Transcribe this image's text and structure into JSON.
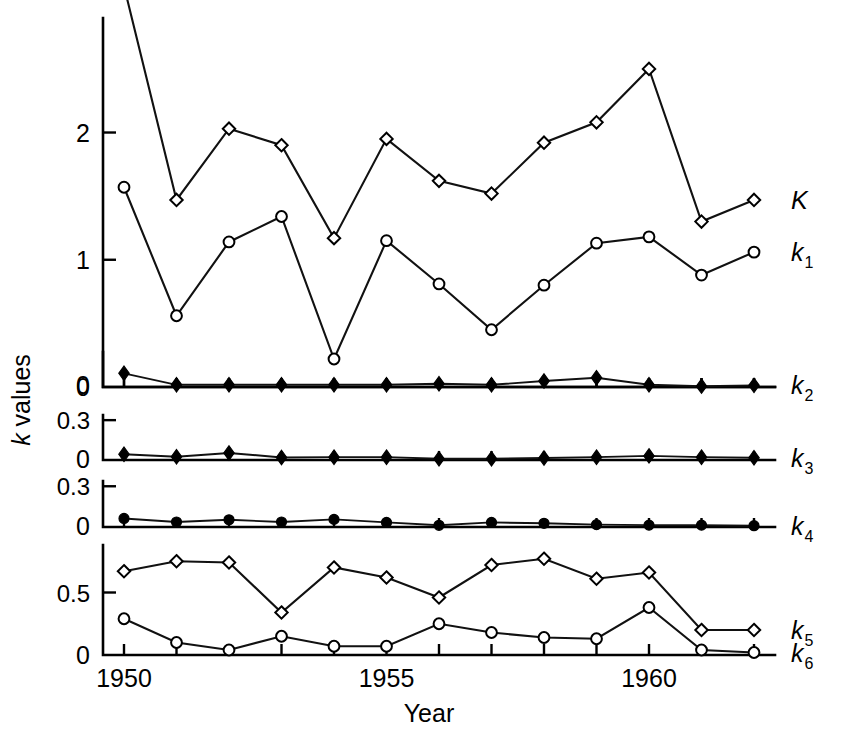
{
  "figure": {
    "y_axis_label_italic": "k",
    "y_axis_label_rest": " values",
    "x_axis_title": "Year",
    "background_color": "#ffffff",
    "line_color": "#111111"
  },
  "chart_data": {
    "type": "line",
    "title": "",
    "xlabel": "Year",
    "ylabel": "k values",
    "grid": false,
    "legend": "right-of-plot-series-labels",
    "x": [
      1950,
      1951,
      1952,
      1953,
      1954,
      1955,
      1956,
      1957,
      1958,
      1959,
      1960,
      1961,
      1962
    ],
    "xtick_labels": [
      "1950",
      "1955",
      "1960"
    ],
    "xtick_values": [
      1950,
      1955,
      1960
    ],
    "xlim": [
      1949.6,
      1962.4
    ],
    "panels": [
      {
        "name": "panel-top",
        "ylim": [
          0,
          2.9
        ],
        "ytick_values": [
          0,
          1,
          2
        ],
        "ytick_labels": [
          "0",
          "1",
          "2"
        ],
        "series": [
          {
            "name": "K",
            "label": "K",
            "label_sub": "",
            "marker": "open-diamond",
            "values": [
              3.15,
              1.47,
              2.03,
              1.9,
              1.17,
              1.95,
              1.62,
              1.52,
              1.92,
              2.08,
              2.5,
              1.3,
              1.47
            ]
          },
          {
            "name": "k1",
            "label": "k",
            "label_sub": "1",
            "marker": "open-circle",
            "values": [
              1.57,
              0.56,
              1.14,
              1.34,
              0.22,
              1.15,
              0.81,
              0.45,
              0.8,
              1.13,
              1.18,
              0.88,
              1.06
            ]
          }
        ]
      },
      {
        "name": "panel-k2",
        "ylim": [
          -0.02,
          0.3
        ],
        "ytick_values": [
          0
        ],
        "ytick_labels": [
          "0"
        ],
        "series": [
          {
            "name": "k2",
            "label": "k",
            "label_sub": "2",
            "marker": "filled-diamond",
            "values": [
              0.105,
              0.0,
              0.0,
              0.0,
              0.0,
              0.0,
              0.01,
              0.0,
              0.035,
              0.065,
              0.0,
              -0.012,
              -0.005
            ]
          }
        ]
      },
      {
        "name": "panel-k3",
        "ylim": [
          -0.01,
          0.34
        ],
        "ytick_values": [
          0,
          0.3
        ],
        "ytick_labels": [
          "0",
          "0.3"
        ],
        "series": [
          {
            "name": "k3",
            "label": "k",
            "label_sub": "3",
            "marker": "filled-diamond",
            "values": [
              0.035,
              0.015,
              0.045,
              0.01,
              0.012,
              0.012,
              0.0,
              0.0,
              0.005,
              0.012,
              0.022,
              0.012,
              0.008
            ]
          }
        ]
      },
      {
        "name": "panel-k4",
        "ylim": [
          -0.01,
          0.34
        ],
        "ytick_values": [
          0,
          0.3
        ],
        "ytick_labels": [
          "0",
          "0.3"
        ],
        "series": [
          {
            "name": "k4",
            "label": "k",
            "label_sub": "4",
            "marker": "filled-circle",
            "values": [
              0.055,
              0.028,
              0.045,
              0.028,
              0.048,
              0.025,
              0.003,
              0.025,
              0.018,
              0.008,
              0.004,
              0.004,
              0.0
            ]
          }
        ]
      },
      {
        "name": "panel-k56",
        "ylim": [
          0,
          0.88
        ],
        "ytick_values": [
          0,
          0.5
        ],
        "ytick_labels": [
          "0",
          "0.5"
        ],
        "series": [
          {
            "name": "k5",
            "label": "k",
            "label_sub": "5",
            "marker": "open-diamond",
            "values": [
              0.67,
              0.75,
              0.74,
              0.34,
              0.7,
              0.62,
              0.46,
              0.72,
              0.77,
              0.61,
              0.66,
              0.2,
              0.2
            ]
          },
          {
            "name": "k6",
            "label": "k",
            "label_sub": "6",
            "marker": "open-circle",
            "values": [
              0.29,
              0.1,
              0.04,
              0.15,
              0.07,
              0.07,
              0.25,
              0.18,
              0.14,
              0.13,
              0.38,
              0.04,
              0.02
            ]
          }
        ]
      }
    ]
  }
}
